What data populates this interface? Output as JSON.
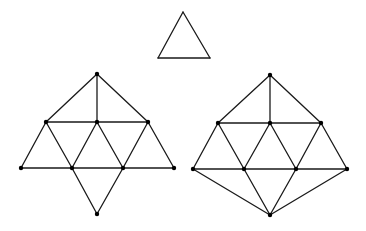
{
  "figures": [
    {
      "id": "triangle",
      "vertices": [
        [
          183,
          12
        ],
        [
          158,
          58
        ],
        [
          210,
          58
        ]
      ],
      "edges": [
        [
          0,
          1
        ],
        [
          1,
          2
        ],
        [
          2,
          0
        ]
      ],
      "show_dots": false
    },
    {
      "id": "left-graph",
      "vertices": [
        [
          97,
          74
        ],
        [
          46,
          122
        ],
        [
          97,
          122
        ],
        [
          148,
          122
        ],
        [
          21,
          168
        ],
        [
          72,
          168
        ],
        [
          123,
          168
        ],
        [
          174,
          168
        ],
        [
          97,
          214
        ]
      ],
      "edges": [
        [
          0,
          1
        ],
        [
          0,
          2
        ],
        [
          0,
          3
        ],
        [
          1,
          2
        ],
        [
          2,
          3
        ],
        [
          1,
          4
        ],
        [
          1,
          5
        ],
        [
          2,
          5
        ],
        [
          2,
          6
        ],
        [
          3,
          6
        ],
        [
          3,
          7
        ],
        [
          4,
          5
        ],
        [
          5,
          6
        ],
        [
          6,
          7
        ],
        [
          5,
          8
        ],
        [
          6,
          8
        ]
      ],
      "show_dots": true
    },
    {
      "id": "right-graph",
      "vertices": [
        [
          270,
          75
        ],
        [
          218,
          123
        ],
        [
          270,
          123
        ],
        [
          321,
          123
        ],
        [
          193,
          169
        ],
        [
          244,
          169
        ],
        [
          296,
          169
        ],
        [
          347,
          169
        ],
        [
          270,
          215
        ]
      ],
      "edges": [
        [
          0,
          1
        ],
        [
          0,
          2
        ],
        [
          0,
          3
        ],
        [
          1,
          2
        ],
        [
          2,
          3
        ],
        [
          1,
          4
        ],
        [
          1,
          5
        ],
        [
          2,
          5
        ],
        [
          2,
          6
        ],
        [
          3,
          6
        ],
        [
          3,
          7
        ],
        [
          4,
          5
        ],
        [
          5,
          6
        ],
        [
          6,
          7
        ],
        [
          4,
          8
        ],
        [
          5,
          8
        ],
        [
          6,
          8
        ],
        [
          7,
          8
        ]
      ],
      "show_dots": true
    }
  ]
}
